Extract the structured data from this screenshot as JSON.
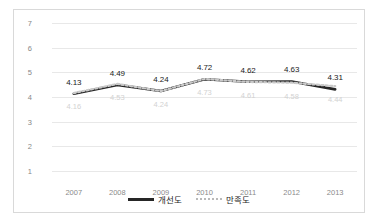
{
  "chart_data": {
    "type": "line",
    "title": "",
    "xlabel": "",
    "ylabel": "",
    "categories": [
      "2007",
      "2008",
      "2009",
      "2010",
      "2011",
      "2012",
      "2013"
    ],
    "ylim": [
      1,
      7
    ],
    "yticks": [
      "1",
      "2",
      "3",
      "4",
      "5",
      "6",
      "7"
    ],
    "grid": true,
    "legend_position": "bottom",
    "series": [
      {
        "name": "개선도",
        "style": "solid",
        "color": "#262626",
        "values": [
          4.13,
          4.49,
          4.24,
          4.72,
          4.62,
          4.63,
          4.31
        ],
        "labels": [
          "4.13",
          "4.49",
          "4.24",
          "4.72",
          "4.62",
          "4.63",
          "4.31"
        ]
      },
      {
        "name": "만족도",
        "style": "dotted",
        "color": "#c9c9c9",
        "values": [
          4.16,
          4.53,
          4.24,
          4.73,
          4.61,
          4.58,
          4.44
        ],
        "labels": [
          "4.16",
          "4.53",
          "4.24",
          "4.73",
          "4.61",
          "4.58",
          "4.44"
        ]
      }
    ]
  },
  "legend": {
    "items": [
      {
        "label": "개선도"
      },
      {
        "label": "만족도"
      }
    ]
  }
}
